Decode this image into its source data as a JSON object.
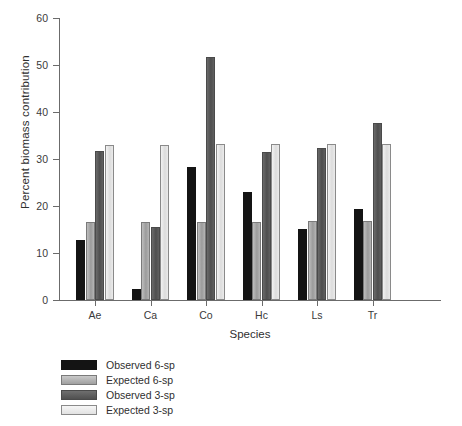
{
  "chart_data": {
    "type": "bar",
    "title": "",
    "xlabel": "Species",
    "ylabel": "Percent biomass contribution",
    "categories": [
      "Ae",
      "Ca",
      "Co",
      "Hc",
      "Ls",
      "Tr"
    ],
    "ylim": [
      0,
      60
    ],
    "yticks": [
      0,
      10,
      20,
      30,
      40,
      50,
      60
    ],
    "ytick_labels": [
      "0",
      "10",
      "20",
      "30",
      "40",
      "50",
      "60"
    ],
    "grid": false,
    "legend_position": "below-left",
    "series": [
      {
        "name": "Observed 6-sp",
        "color": "#141414",
        "values": [
          12.8,
          2.3,
          28.3,
          22.9,
          15.1,
          19.3
        ]
      },
      {
        "name": "Expected 6-sp",
        "color": "#a8a8a8",
        "values": [
          16.7,
          16.7,
          16.7,
          16.7,
          16.8,
          16.8
        ]
      },
      {
        "name": "Observed 3-sp",
        "color": "#565656",
        "values": [
          31.8,
          15.6,
          51.7,
          31.5,
          32.4,
          37.6
        ]
      },
      {
        "name": "Expected 3-sp",
        "color": "#e4e4e4",
        "values": [
          33.0,
          33.0,
          33.2,
          33.1,
          33.1,
          33.2
        ]
      }
    ]
  },
  "axes": {
    "y_title": "Percent biomass contribution",
    "x_title": "Species"
  },
  "legend": {
    "items": [
      {
        "label": "Observed 6-sp"
      },
      {
        "label": "Expected 6-sp"
      },
      {
        "label": "Observed 3-sp"
      },
      {
        "label": "Expected 3-sp"
      }
    ]
  }
}
